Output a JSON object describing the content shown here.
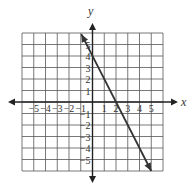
{
  "chart_data": {
    "type": "line",
    "title": "",
    "xlabel": "x",
    "ylabel": "y",
    "xlim": [
      -6,
      6
    ],
    "ylim": [
      -6,
      6
    ],
    "grid": true,
    "x_ticks": [
      -5,
      -4,
      -3,
      -2,
      -1,
      1,
      2,
      3,
      4,
      5
    ],
    "y_ticks": [
      5,
      4,
      3,
      2,
      1,
      -1,
      -2,
      -3,
      -4,
      -5
    ],
    "x_tick_labels": [
      "−5",
      "−4",
      "−3",
      "−2",
      "−1",
      "1",
      "2",
      "3",
      "4",
      "5"
    ],
    "y_tick_labels": [
      "5",
      "4",
      "3",
      "2",
      "1",
      "−1",
      "−2",
      "−3",
      "−4",
      "−5"
    ],
    "series": [
      {
        "name": "y = -2x + 4",
        "equation": {
          "slope": -2,
          "intercept": 4
        },
        "x": [
          -0.95,
          5.0
        ],
        "y": [
          5.9,
          -6.0
        ],
        "arrows": "both"
      }
    ],
    "colors": {
      "line": "#333333",
      "grid": "#555555",
      "axis": "#222222"
    }
  }
}
